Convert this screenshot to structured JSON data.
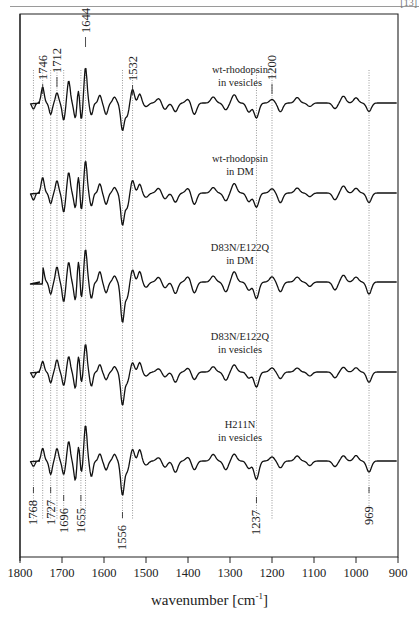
{
  "page": {
    "marker": "[13]"
  },
  "chart_data": {
    "type": "line",
    "title": "",
    "xlabel": "wavenumber [cm-1]",
    "xlabel_main": "wavenumber [cm",
    "xlabel_sup": "-1",
    "xlabel_end": "]",
    "ylabel": "",
    "xlim": [
      1800,
      900
    ],
    "x_reversed": true,
    "x_ticks": [
      1800,
      1700,
      1600,
      1500,
      1400,
      1300,
      1200,
      1100,
      1000,
      900
    ],
    "grid": false,
    "legend_position": "inline labels",
    "series": [
      {
        "name": "wt-rhodopsin in vesicles",
        "line1": "wt-rhodopsin",
        "line2": "in vesicles"
      },
      {
        "name": "wt-rhodopsin in DM",
        "line1": "wt-rhodopsin",
        "line2": "in DM"
      },
      {
        "name": "D83N/E122Q in DM",
        "line1": "D83N/E122Q",
        "line2": "in DM"
      },
      {
        "name": "D83N/E122Q in vesicles",
        "line1": "D83N/E122Q",
        "line2": "in vesicles"
      },
      {
        "name": "H211N in vesicles",
        "line1": "H211N",
        "line2": "in vesicles"
      }
    ],
    "annotations_top": [
      1746,
      1712,
      1644,
      1532,
      1200
    ],
    "annotations_bottom": [
      1768,
      1727,
      1696,
      1655,
      1556,
      1237,
      969
    ],
    "reference_lines": [
      1768,
      1746,
      1727,
      1712,
      1696,
      1655,
      1644,
      1556,
      1532,
      1237,
      1200,
      969
    ]
  }
}
